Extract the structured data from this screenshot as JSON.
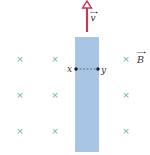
{
  "diagram": {
    "type": "physics-motional-emf",
    "bar": {
      "color": "#a8c4e4",
      "x": 75,
      "y": 37,
      "width": 24,
      "height": 115
    },
    "velocity": {
      "label": "v",
      "has_vector_arrow": true,
      "color": "#c0305a"
    },
    "field": {
      "label": "B",
      "has_vector_arrow": true,
      "direction": "into-page",
      "symbol": "×",
      "symbol_color": "#5aa39a"
    },
    "points": [
      {
        "label": "x",
        "cx": 76,
        "cy": 69
      },
      {
        "label": "y",
        "cx": 98,
        "cy": 69
      }
    ],
    "crosses": [
      {
        "x": 20,
        "y": 59
      },
      {
        "x": 55,
        "y": 59
      },
      {
        "x": 126,
        "y": 59
      },
      {
        "x": 20,
        "y": 95
      },
      {
        "x": 55,
        "y": 95
      },
      {
        "x": 126,
        "y": 95
      },
      {
        "x": 20,
        "y": 131
      },
      {
        "x": 55,
        "y": 131
      },
      {
        "x": 126,
        "y": 131
      }
    ]
  }
}
